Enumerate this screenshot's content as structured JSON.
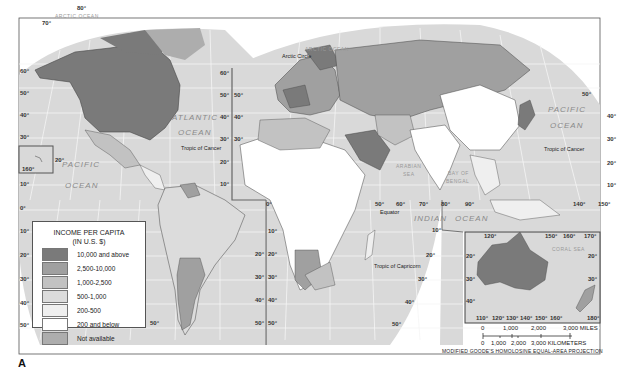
{
  "figure_label": "A",
  "projection": "MODIFIED GOODE'S HOMOLOSINE EQUAL-AREA PROJECTION",
  "legend": {
    "title_line1": "INCOME PER CAPITA",
    "title_line2": "(IN U.S. $)",
    "items": [
      {
        "label": "10,000 and above",
        "color": "#7a7a7a"
      },
      {
        "label": "2,500-10,000",
        "color": "#a0a0a0"
      },
      {
        "label": "1,000-2,500",
        "color": "#c2c2c2"
      },
      {
        "label": "500-1,000",
        "color": "#dcdcdc"
      },
      {
        "label": "200-500",
        "color": "#efefef"
      },
      {
        "label": "200 and below",
        "color": "#ffffff"
      },
      {
        "label": "Not available",
        "color": "#adadad"
      }
    ]
  },
  "oceans": {
    "atlantic_1": "ATLANTIC",
    "atlantic_2": "OCEAN",
    "pacific_w1": "PACIFIC",
    "pacific_w2": "OCEAN",
    "pacific_e1": "PACIFIC",
    "pacific_e2": "OCEAN",
    "indian_1": "INDIAN",
    "indian_2": "OCEAN",
    "arctic_w": "ARCTIC OCEAN",
    "arctic_e": "ARCTIC OCEAN"
  },
  "seas": {
    "arabian_1": "ARABIAN",
    "arabian_2": "SEA",
    "bengal_1": "BAY OF",
    "bengal_2": "BENGAL",
    "coral": "CORAL SEA"
  },
  "lines": {
    "tropic_cancer": "Tropic of Cancer",
    "tropic_capricorn": "Tropic of Capricorn",
    "equator": "Equator",
    "arctic_circle": "Arctic Circle"
  },
  "scale": {
    "miles_ticks": [
      "0",
      "1,000",
      "2,000",
      "3,000 MILES"
    ],
    "km_ticks": [
      "0",
      "1,000",
      "2,000",
      "3,000 KILOMETERS"
    ]
  },
  "degrees": {
    "w_lat": [
      "70°",
      "60°",
      "50°",
      "40°",
      "30°",
      "20°",
      "10°",
      "0°",
      "10°",
      "20°",
      "30°",
      "40°",
      "50°"
    ],
    "mid_lat": [
      "60°",
      "50°",
      "40°",
      "30°",
      "20°",
      "10°",
      "0°",
      "10°",
      "20°",
      "30°",
      "40°",
      "50°"
    ],
    "e_lon": [
      "50°",
      "60°",
      "70°",
      "80°",
      "90°",
      "140°",
      "150°"
    ],
    "e_lat": [
      "50°",
      "40°",
      "30°",
      "20°",
      "10°"
    ],
    "top_lon": "80°",
    "hawaii_lon": "160°",
    "hawaii_lat": "20°",
    "aus_top": [
      "120°",
      "150°",
      "160°",
      "170°"
    ],
    "aus_bottom": [
      "110°",
      "120°",
      "130°",
      "140°",
      "150°",
      "160°",
      "180°"
    ],
    "aus_lat": [
      "20°",
      "30°",
      "40°"
    ]
  }
}
